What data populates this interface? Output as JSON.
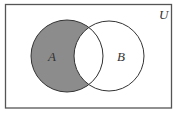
{
  "diagram": {
    "type": "venn",
    "universe_label": "U",
    "sets": [
      {
        "name": "A",
        "label": "A"
      },
      {
        "name": "B",
        "label": "B"
      }
    ],
    "shaded_region": "A minus B",
    "colors": {
      "shade": "#8c8c8c",
      "stroke": "#333333",
      "background": "#ffffff",
      "frame": "#555555"
    }
  }
}
